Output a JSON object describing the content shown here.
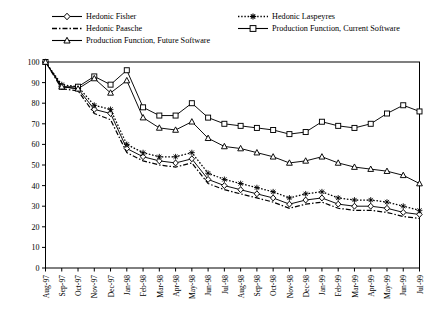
{
  "chart_data": {
    "type": "line",
    "title": "",
    "xlabel": "",
    "ylabel": "",
    "ylim": [
      0,
      100
    ],
    "yticks": [
      0,
      10,
      20,
      30,
      40,
      50,
      60,
      70,
      80,
      90,
      100
    ],
    "grid": false,
    "legend_position": "top",
    "categories": [
      "Aug-97",
      "Sep-97",
      "Oct-97",
      "Nov-97",
      "Dec-97",
      "Jan-98",
      "Feb-98",
      "Mar-98",
      "Apr-98",
      "May-98",
      "Jun-98",
      "Jul-98",
      "Aug-98",
      "Sep-98",
      "Oct-98",
      "Nov-98",
      "Dec-98",
      "Jan-99",
      "Feb-99",
      "Mar-99",
      "Apr-99",
      "May-99",
      "Jun-99",
      "Jul-99"
    ],
    "series": [
      {
        "name": "Hedonic Fisher",
        "marker": "diamond",
        "dash": "solid",
        "color": "#000000",
        "values": [
          100,
          88,
          87,
          77,
          75,
          58,
          54,
          52,
          51,
          53,
          43,
          40,
          38,
          36,
          34,
          31,
          33,
          34,
          31,
          30,
          30,
          29,
          27,
          26
        ]
      },
      {
        "name": "Hedonic Laspeyres",
        "marker": "star",
        "dash": "dotted",
        "color": "#000000",
        "values": [
          100,
          89,
          88,
          79,
          77,
          60,
          56,
          54,
          54,
          56,
          46,
          43,
          41,
          39,
          37,
          34,
          36,
          37,
          34,
          33,
          33,
          32,
          30,
          28
        ]
      },
      {
        "name": "Hedonic Paasche",
        "marker": "none",
        "dash": "dashdot",
        "color": "#000000",
        "values": [
          100,
          87,
          86,
          75,
          72,
          56,
          52,
          50,
          49,
          51,
          41,
          38,
          36,
          34,
          32,
          29,
          31,
          32,
          29,
          28,
          28,
          27,
          25,
          24
        ]
      },
      {
        "name": "Production Function, Current Software",
        "marker": "square",
        "dash": "solid",
        "color": "#000000",
        "values": [
          100,
          88,
          88,
          93,
          89,
          96,
          78,
          74,
          74,
          80,
          73,
          70,
          69,
          68,
          67,
          65,
          66,
          71,
          69,
          68,
          70,
          75,
          79,
          76
        ]
      },
      {
        "name": "Production Function, Future Software",
        "marker": "triangle",
        "dash": "solid",
        "color": "#000000",
        "values": [
          100,
          88,
          87,
          92,
          85,
          91,
          73,
          68,
          67,
          71,
          63,
          59,
          58,
          56,
          54,
          51,
          52,
          54,
          51,
          49,
          48,
          47,
          45,
          41
        ]
      }
    ]
  },
  "legend": {
    "items": [
      {
        "label": "Hedonic Fisher",
        "series_index": 0
      },
      {
        "label": "Hedonic Laspeyres",
        "series_index": 1
      },
      {
        "label": "Hedonic Paasche",
        "series_index": 2
      },
      {
        "label": "Production Function, Current Software",
        "series_index": 3
      },
      {
        "label": "Production Function, Future Software",
        "series_index": 4
      }
    ]
  },
  "axes": {
    "y_tick_labels": [
      "100",
      "90",
      "80",
      "70",
      "60",
      "50",
      "40",
      "30",
      "20",
      "10",
      "0"
    ],
    "x_tick_labels": [
      "Aug-97",
      "Sep-97",
      "Oct-97",
      "Nov-97",
      "Dec-97",
      "Jan-98",
      "Feb-98",
      "Mar-98",
      "Apr-98",
      "May-98",
      "Jun-98",
      "Jul-98",
      "Aug-98",
      "Sep-98",
      "Oct-98",
      "Nov-98",
      "Dec-98",
      "Jan-99",
      "Feb-99",
      "Mar-99",
      "Apr-99",
      "May-99",
      "Jun-99",
      "Jul-99"
    ]
  }
}
